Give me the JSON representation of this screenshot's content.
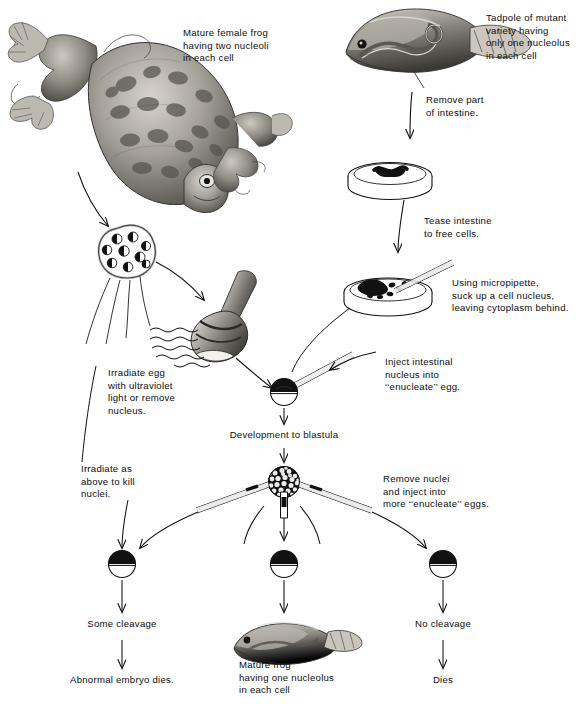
{
  "figure": {
    "type": "biology-process-diagram",
    "background": "#ffffff",
    "ink": "#111111"
  },
  "labels": {
    "mature_female_frog": "Mature female frog\nhaving two nucleoli\nin each cell",
    "tadpole_mutant": "Tadpole of mutant\nvariety having\nonly one nucleolus\nin each cell",
    "remove_intestine": "Remove part\nof intestine.",
    "tease_intestine": "Tease intestine\nto free cells.",
    "micropipette": "Using micropipette,\nsuck up a cell nucleus,\nleaving cytoplasm behind.",
    "irradiate_egg": "Irradiate egg\nwith ultraviolet\nlight or remove\nnucleus.",
    "inject_nucleus": "Inject intestinal\nnucleus into\n‘‘enucleate’’ egg.",
    "development_blastula": "Development to blastula",
    "irradiate_as_above": "Irradiate as\nabove to kill\nnuclei.",
    "remove_nuclei": "Remove nuclei\nand inject into\nmore ‘‘enucleate’’ eggs.",
    "some_cleavage": "Some cleavage",
    "abnormal_embryo": "Abnormal embryo dies.",
    "mature_frog_result": "Mature frog\nhaving one nucleolus\nin each cell",
    "no_cleavage": "No cleavage",
    "dies": "Dies"
  },
  "objects": {
    "frog_adult": "adult-frog-illustration",
    "tadpole": "tadpole-illustration",
    "egg_cluster": "egg-cluster-ovary",
    "uv_lamp": "ultraviolet-lamp",
    "petri_dish_intestine": "petri-dish-with-intestine",
    "petri_dish_cells": "petri-dish-with-free-cells",
    "pipette": "micropipette",
    "egg_enucleate": "enucleate-egg",
    "blastula": "blastula",
    "eggs_row": [
      "egg-left",
      "egg-center",
      "egg-right"
    ],
    "frog_result": "mature-frog-illustration"
  },
  "counts": {
    "eggs_in_cluster": 9,
    "bottom_row_eggs": 3,
    "blastula_cells_visible": 26
  }
}
